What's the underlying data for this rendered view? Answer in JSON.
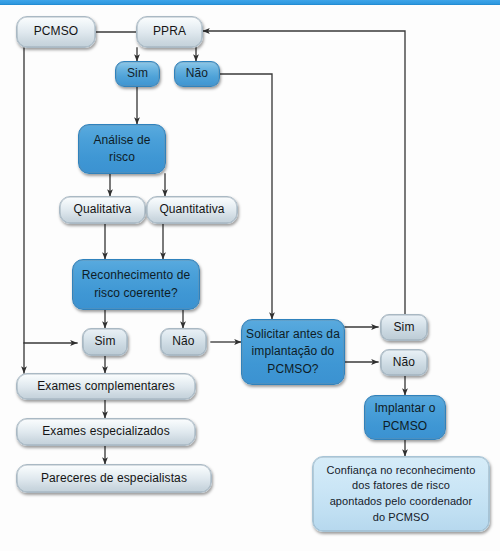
{
  "diagram": {
    "language": "pt-BR",
    "colors": {
      "top_strip": "#2f99e0",
      "solid_blue": "#3f97d4",
      "pill_blue": "#4ea2d8",
      "pale_box": "#dfe8ee",
      "palest_box": "#c6e3f4",
      "connector": "#3a3a3a",
      "text": "#141414",
      "page_background": "#fdfdfd"
    }
  },
  "nodes": {
    "pcmso": {
      "label": "PCMSO",
      "style": "pale"
    },
    "ppra": {
      "label": "PPRA",
      "style": "pale"
    },
    "ppra_sim": {
      "label": "Sim",
      "style": "pill-blue"
    },
    "ppra_nao": {
      "label": "Não",
      "style": "pill-blue"
    },
    "analise_risco": {
      "line1": "Análise de",
      "line2": "risco",
      "style": "solid"
    },
    "qualitativa": {
      "label": "Qualitativa",
      "style": "pale"
    },
    "quantitativa": {
      "label": "Quantitativa",
      "style": "pale"
    },
    "reconhecimento": {
      "line1": "Reconhecimento de",
      "line2": "risco coerente?",
      "style": "solid"
    },
    "reconh_sim": {
      "label": "Sim",
      "style": "pill-pale"
    },
    "reconh_nao": {
      "label": "Não",
      "style": "pill-pale"
    },
    "exames_compl": {
      "label": "Exames complementares",
      "style": "pale"
    },
    "exames_espec": {
      "label": "Exames especializados",
      "style": "pale"
    },
    "pareceres": {
      "label": "Pareceres de especialistas",
      "style": "pale"
    },
    "solicitar": {
      "line1": "Solicitar antes da",
      "line2": "implantação do",
      "line3": "PCMSO?",
      "style": "solid"
    },
    "solic_sim": {
      "label": "Sim",
      "style": "pill-pale"
    },
    "solic_nao": {
      "label": "Não",
      "style": "pill-pale"
    },
    "implantar": {
      "line1": "Implantar o",
      "line2": "PCMSO",
      "style": "solid"
    },
    "confianca": {
      "line1": "Confiança no reconhecimento",
      "line2": "dos fatores de risco",
      "line3": "apontados pelo coordenador",
      "line4": "do PCMSO",
      "style": "palest"
    }
  },
  "edges": [
    {
      "id": "pcmso-to-ppra",
      "from": "pcmso",
      "to": "ppra",
      "arrow": false
    },
    {
      "id": "ppra-to-sim",
      "from": "ppra",
      "to": "ppra_sim",
      "arrow": true
    },
    {
      "id": "ppra-to-nao",
      "from": "ppra",
      "to": "ppra_nao",
      "arrow": true
    },
    {
      "id": "sim-to-analise",
      "from": "ppra_sim",
      "to": "analise_risco",
      "arrow": true
    },
    {
      "id": "analise-to-qualitativa",
      "from": "analise_risco",
      "to": "qualitativa",
      "arrow": true
    },
    {
      "id": "analise-to-quantitativa",
      "from": "analise_risco",
      "to": "quantitativa",
      "arrow": true
    },
    {
      "id": "qualitativa-to-reconh",
      "from": "qualitativa",
      "to": "reconhecimento",
      "arrow": true
    },
    {
      "id": "quantitativa-to-reconh",
      "from": "quantitativa",
      "to": "reconhecimento",
      "arrow": true
    },
    {
      "id": "reconh-to-sim",
      "from": "reconhecimento",
      "to": "reconh_sim",
      "arrow": true
    },
    {
      "id": "reconh-to-nao",
      "from": "reconhecimento",
      "to": "reconh_nao",
      "arrow": true
    },
    {
      "id": "reconh-sim-to-exames",
      "from": "reconh_sim",
      "to": "exames_compl",
      "arrow": true
    },
    {
      "id": "pcmso-to-reconh-sim",
      "from": "pcmso",
      "to": "reconh_sim",
      "arrow": true
    },
    {
      "id": "pcmso-to-exames",
      "from": "pcmso",
      "to": "exames_compl",
      "arrow": true
    },
    {
      "id": "exames-to-especializados",
      "from": "exames_compl",
      "to": "exames_espec",
      "arrow": true
    },
    {
      "id": "especializados-to-parec",
      "from": "exames_espec",
      "to": "pareceres",
      "arrow": true
    },
    {
      "id": "ppra-nao-to-solicitar",
      "from": "ppra_nao",
      "to": "solicitar",
      "arrow": true
    },
    {
      "id": "reconh-nao-to-solicitar",
      "from": "reconh_nao",
      "to": "solicitar",
      "arrow": true
    },
    {
      "id": "solicitar-to-sim",
      "from": "solicitar",
      "to": "solic_sim",
      "arrow": true
    },
    {
      "id": "solicitar-to-nao",
      "from": "solicitar",
      "to": "solic_nao",
      "arrow": true
    },
    {
      "id": "solic-sim-to-ppra",
      "from": "solic_sim",
      "to": "ppra",
      "arrow": true
    },
    {
      "id": "solic-nao-to-implantar",
      "from": "solic_nao",
      "to": "implantar",
      "arrow": true
    },
    {
      "id": "implantar-to-confianca",
      "from": "implantar",
      "to": "confianca",
      "arrow": true
    }
  ]
}
